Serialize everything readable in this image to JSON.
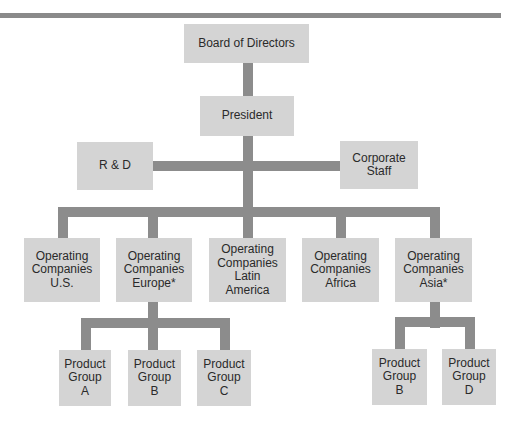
{
  "diagram": {
    "type": "org-chart",
    "nodes": {
      "board": "Board of Directors",
      "president": "President",
      "rnd": "R & D",
      "corporate_staff": "Corporate\nStaff",
      "op_us": "Operating\nCompanies\nU.S.",
      "op_europe": "Operating\nCompanies\nEurope*",
      "op_latin": "Operating\nCompanies\nLatin\nAmerica",
      "op_africa": "Operating\nCompanies\nAfrica",
      "op_asia": "Operating\nCompanies\nAsia*",
      "eu_pg_a": "Product\nGroup\nA",
      "eu_pg_b": "Product\nGroup\nB",
      "eu_pg_c": "Product\nGroup\nC",
      "asia_pg_b": "Product\nGroup\nB",
      "asia_pg_d": "Product\nGroup\nD"
    },
    "edges": [
      [
        "board",
        "president"
      ],
      [
        "president",
        "rnd"
      ],
      [
        "president",
        "corporate_staff"
      ],
      [
        "president",
        "op_us"
      ],
      [
        "president",
        "op_europe"
      ],
      [
        "president",
        "op_latin"
      ],
      [
        "president",
        "op_africa"
      ],
      [
        "president",
        "op_asia"
      ],
      [
        "op_europe",
        "eu_pg_a"
      ],
      [
        "op_europe",
        "eu_pg_b"
      ],
      [
        "op_europe",
        "eu_pg_c"
      ],
      [
        "op_asia",
        "asia_pg_b"
      ],
      [
        "op_asia",
        "asia_pg_d"
      ]
    ],
    "colors": {
      "box": "#d4d4d4",
      "connector": "#8c8c8c",
      "text": "#2a2a2a"
    }
  }
}
